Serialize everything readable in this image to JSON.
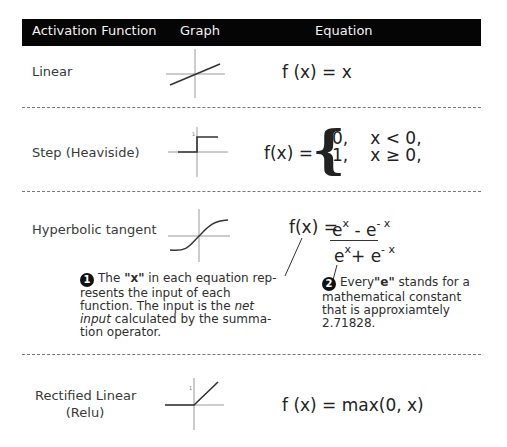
{
  "header": {
    "col_function": "Activation Function",
    "col_graph": "Graph",
    "col_equation": "Equation"
  },
  "rows": [
    {
      "name": "Linear",
      "graph_icon": "linear-graph-icon",
      "equation": "f (x) = x"
    },
    {
      "name": "Step (Heaviside)",
      "graph_icon": "step-graph-icon",
      "equation_lhs": "f(x) =",
      "cases": [
        {
          "value": "0,",
          "condition": "x < 0,"
        },
        {
          "value": "1,",
          "condition": "x ≥ 0,"
        }
      ]
    },
    {
      "name": "Hyperbolic tangent",
      "graph_icon": "tanh-graph-icon",
      "equation_lhs": "f(x) =",
      "numerator": {
        "a": "e",
        "a_exp": "x",
        "op": "-",
        "b": "e",
        "b_exp": "- x"
      },
      "denominator": {
        "a": "e",
        "a_exp": "x",
        "op": "+",
        "b": "e",
        "b_exp": "- x"
      }
    },
    {
      "name_line1": "Rectified Linear",
      "name_line2": "(Relu)",
      "graph_icon": "relu-graph-icon",
      "equation": "f (x) = max(0, x)"
    }
  ],
  "notes": [
    {
      "number": "1",
      "pre": "The ",
      "bold": "\"x\"",
      "mid": " in each equation rep-resents the input of each function. The input is the ",
      "italic": "net input",
      "post": " calculated by the summa-tion operator."
    },
    {
      "number": "2",
      "pre": "Every",
      "bold": "\"e\"",
      "post": " stands for a mathematical constant that is approxiamtely 2.71828."
    }
  ],
  "graph_tick_label": "1",
  "colors": {
    "header_bg": "#050505",
    "header_text": "#f2f2f2",
    "axis": "#9a9a9a",
    "curve": "#333333"
  }
}
